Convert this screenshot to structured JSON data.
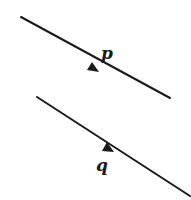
{
  "diagram": {
    "lines": [
      {
        "id": "p",
        "label": "p",
        "x1": 21,
        "y1": 17,
        "x2": 170,
        "y2": 98,
        "arrow_at": [
          98,
          72
        ],
        "label_pos": [
          104,
          57
        ]
      },
      {
        "id": "q",
        "label": "q",
        "x1": 37,
        "y1": 97,
        "x2": 190,
        "y2": 196,
        "arrow_at": [
          112,
          152
        ],
        "label_pos": [
          97,
          171
        ]
      }
    ],
    "colors": {
      "stroke": "#1a1a1a",
      "background": "#ffffff"
    }
  }
}
